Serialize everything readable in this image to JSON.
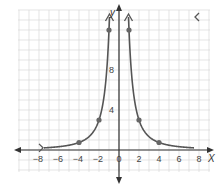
{
  "chart_data": {
    "type": "line",
    "title": "",
    "function": "y = 12 / x^2",
    "xlabel": "x",
    "ylabel": "y",
    "xlim": [
      -10,
      9
    ],
    "ylim": [
      -3,
      13
    ],
    "grid": true,
    "x_ticks": [
      -8,
      -6,
      -4,
      -2,
      0,
      2,
      4,
      6,
      8
    ],
    "x_tick_labels": [
      "-8",
      "-6",
      "-4",
      "-2",
      "0",
      "2",
      "4",
      "6",
      "8"
    ],
    "y_ticks": [
      4,
      8
    ],
    "y_tick_labels": [
      "4",
      "8"
    ],
    "points": [
      {
        "x": -4,
        "y": 0.75
      },
      {
        "x": -2,
        "y": 3
      },
      {
        "x": -1,
        "y": 12
      },
      {
        "x": 1,
        "y": 12
      },
      {
        "x": 2,
        "y": 3
      },
      {
        "x": 4,
        "y": 0.75
      }
    ],
    "series": [
      {
        "name": "left branch",
        "x_range": [
          -7.5,
          -0.95
        ]
      },
      {
        "name": "right branch",
        "x_range": [
          0.95,
          7.5
        ]
      }
    ],
    "colors": {
      "curve": "#555555",
      "points": "#666666",
      "axes": "#333333",
      "grid": "#d8d8d8"
    }
  }
}
